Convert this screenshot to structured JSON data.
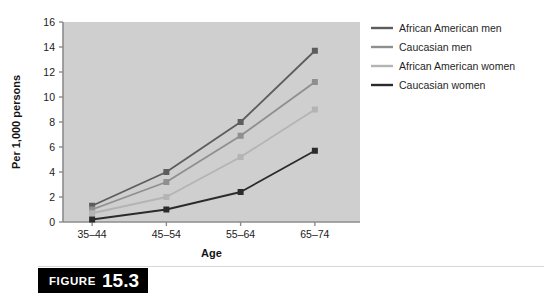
{
  "figure": {
    "caption_word": "FIGURE",
    "caption_number": "15.3"
  },
  "colors": {
    "plot_background": "#cfcfcf",
    "axis": "#8c8c8c",
    "african_american_men": "#5d5d5d",
    "caucasian_men": "#8f8f8f",
    "african_american_women": "#b4b4b4",
    "caucasian_women": "#2b2b2b"
  },
  "chart_data": {
    "type": "line",
    "title": "",
    "xlabel": "Age",
    "ylabel": "Per 1,000 persons",
    "categories": [
      "35–44",
      "45–54",
      "55–64",
      "65–74"
    ],
    "ylim": [
      0,
      16
    ],
    "yticks": [
      0,
      2,
      4,
      6,
      8,
      10,
      12,
      14,
      16
    ],
    "ytick_labels": [
      "0",
      "2",
      "4",
      "6",
      "8",
      "10",
      "12",
      "14",
      "16"
    ],
    "grid": false,
    "legend_position": "right",
    "markers": "square",
    "series": [
      {
        "name": "African American men",
        "color": "#5d5d5d",
        "values": [
          1.3,
          4.0,
          8.0,
          13.7
        ]
      },
      {
        "name": "Caucasian men",
        "color": "#8f8f8f",
        "values": [
          1.0,
          3.2,
          6.9,
          11.2
        ]
      },
      {
        "name": "African American women",
        "color": "#b4b4b4",
        "values": [
          0.7,
          2.0,
          5.2,
          9.0
        ]
      },
      {
        "name": "Caucasian women",
        "color": "#2b2b2b",
        "values": [
          0.2,
          1.0,
          2.4,
          5.7
        ]
      }
    ]
  }
}
